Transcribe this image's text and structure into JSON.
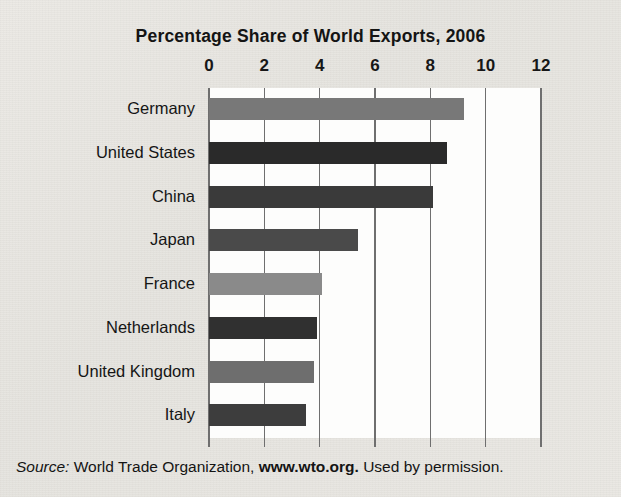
{
  "figure": {
    "title": "Percentage Share of World Exports, 2006",
    "source": {
      "label": "Source:",
      "organization": "World Trade Organization,",
      "url": "www.wto.org.",
      "permission": "Used by permission."
    }
  },
  "chart_data": {
    "type": "bar",
    "orientation": "horizontal",
    "title": "Percentage Share of World Exports, 2006",
    "xlabel": "",
    "ylabel": "",
    "categories": [
      "Germany",
      "United States",
      "China",
      "Japan",
      "France",
      "Netherlands",
      "United Kingdom",
      "Italy"
    ],
    "values": [
      9.2,
      8.6,
      8.1,
      5.4,
      4.1,
      3.9,
      3.8,
      3.5
    ],
    "bar_colors": [
      "#787878",
      "#2a2a2a",
      "#3a3a3a",
      "#4a4a4a",
      "#8a8a8a",
      "#303030",
      "#6e6e6e",
      "#3d3d3d"
    ],
    "xlim": [
      0,
      12
    ],
    "xticks": [
      0,
      2,
      4,
      6,
      8,
      10,
      12
    ],
    "xtick_labels": [
      "0",
      "2",
      "4",
      "6",
      "8",
      "10",
      "12"
    ],
    "grid": "vertical",
    "gridline_color": "#6f6f6f",
    "plot_background": "#fdfdfc",
    "figure_background": "#e9e7e2",
    "legend": null
  }
}
